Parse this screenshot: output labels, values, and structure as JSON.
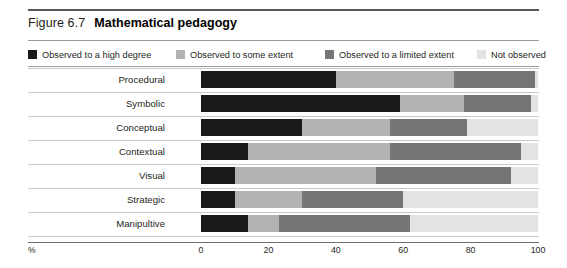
{
  "figure": {
    "number_label": "Figure 6.7",
    "title": "Mathematical pedagogy"
  },
  "legend": {
    "items": [
      {
        "label": "Observed to a high degree",
        "color": "#1a1a1a"
      },
      {
        "label": "Observed to some extent",
        "color": "#b3b3b3"
      },
      {
        "label": "Observed to a limited extent",
        "color": "#757577"
      },
      {
        "label": "Not observed",
        "color": "#e3e3e3"
      }
    ]
  },
  "axis": {
    "unit_label": "%",
    "ticks": [
      "0",
      "20",
      "40",
      "60",
      "80",
      "100"
    ]
  },
  "chart_data": {
    "type": "bar",
    "orientation": "horizontal",
    "stacked": true,
    "stack_total": 100,
    "title": "Mathematical pedagogy",
    "xlabel": "%",
    "ylabel": "",
    "xlim": [
      0,
      100
    ],
    "xticks": [
      0,
      20,
      40,
      60,
      80,
      100
    ],
    "grid": false,
    "legend_position": "top",
    "categories": [
      "Procedural",
      "Symbolic",
      "Conceptual",
      "Contextual",
      "Visual",
      "Strategic",
      "Manipultive"
    ],
    "series": [
      {
        "name": "Observed to a high degree",
        "color": "#1a1a1a",
        "values": [
          40,
          59,
          30,
          14,
          10,
          10,
          14
        ]
      },
      {
        "name": "Observed to some extent",
        "color": "#b3b3b3",
        "values": [
          35,
          19,
          26,
          42,
          42,
          20,
          9
        ]
      },
      {
        "name": "Observed to a limited extent",
        "color": "#757577",
        "values": [
          24,
          20,
          23,
          39,
          40,
          30,
          39
        ]
      },
      {
        "name": "Not observed",
        "color": "#e3e3e3",
        "values": [
          1,
          2,
          21,
          5,
          8,
          40,
          38
        ]
      }
    ]
  },
  "colors": {
    "top_rule": "#58595b",
    "thin_rule": "#9a9b9e",
    "row_sep": "#c8c9cb",
    "axis_line": "#6d6e71",
    "text": "#231f20"
  }
}
